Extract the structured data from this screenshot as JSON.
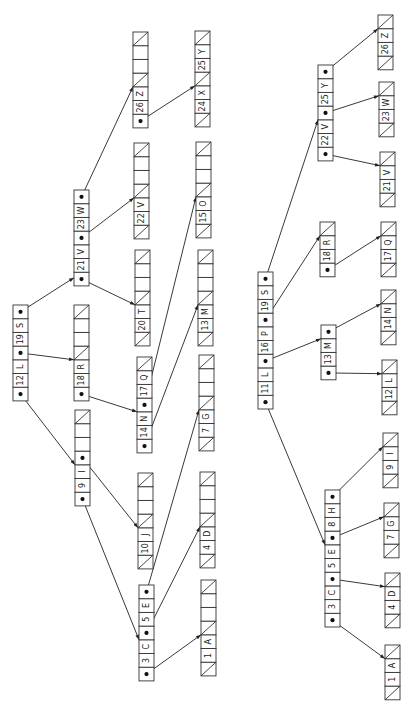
{
  "figure": {
    "orientation": "rotated-ccw",
    "cell_height": 13.7,
    "cell_width": 15
  },
  "trees": [
    {
      "name": "left-tree",
      "nodes": [
        {
          "id": "L-root",
          "x": 13,
          "y": 305,
          "cells": [
            "ptr",
            "12",
            "L",
            "ptr",
            "19",
            "S",
            "ptr"
          ]
        },
        {
          "id": "L-21V23W",
          "x": 74,
          "y": 190,
          "cells": [
            "ptr",
            "21",
            "V",
            "ptr",
            "23",
            "W",
            "ptr"
          ]
        },
        {
          "id": "L-18R",
          "x": 74,
          "y": 305,
          "cells": [
            "ptr",
            "18",
            "R",
            "nil",
            "",
            "",
            "nil"
          ]
        },
        {
          "id": "L-9I",
          "x": 75,
          "y": 410,
          "cells": [
            "ptr",
            "9",
            "I",
            "ptr",
            "",
            "",
            "nil"
          ]
        },
        {
          "id": "L-26Z",
          "x": 133,
          "y": 32,
          "cells": [
            "ptr",
            "26",
            "Z",
            "nil",
            "",
            "",
            "nil"
          ]
        },
        {
          "id": "L-22V",
          "x": 134,
          "y": 143,
          "cells": [
            "nil",
            "22",
            "V",
            "nil",
            "",
            "",
            "nil"
          ]
        },
        {
          "id": "L-20T",
          "x": 135,
          "y": 250,
          "cells": [
            "nil",
            "20",
            "T",
            "nil",
            "",
            "",
            "nil"
          ]
        },
        {
          "id": "L-14N17Q",
          "x": 137,
          "y": 357,
          "cells": [
            "ptr",
            "14",
            "N",
            "ptr",
            "17",
            "Q",
            "nil"
          ]
        },
        {
          "id": "L-10J",
          "x": 138,
          "y": 473,
          "cells": [
            "nil",
            "10",
            "J",
            "nil",
            "",
            "",
            "nil"
          ]
        },
        {
          "id": "L-3C5E",
          "x": 139,
          "y": 585,
          "cells": [
            "ptr",
            "3",
            "C",
            "ptr",
            "5",
            "E",
            "ptr"
          ]
        },
        {
          "id": "L-24X25Y",
          "x": 195,
          "y": 31,
          "cells": [
            "nil",
            "24",
            "X",
            "nil",
            "25",
            "Y",
            "nil"
          ]
        },
        {
          "id": "L-15O",
          "x": 196,
          "y": 142,
          "cells": [
            "nil",
            "15",
            "O",
            "nil",
            "",
            "",
            "nil"
          ]
        },
        {
          "id": "L-13M",
          "x": 198,
          "y": 250,
          "cells": [
            "nil",
            "13",
            "M",
            "nil",
            "",
            "",
            "nil"
          ]
        },
        {
          "id": "L-7G",
          "x": 199,
          "y": 355,
          "cells": [
            "nil",
            "7",
            "G",
            "nil",
            "",
            "",
            "nil"
          ]
        },
        {
          "id": "L-4D",
          "x": 200,
          "y": 472,
          "cells": [
            "nil",
            "4",
            "D",
            "nil",
            "",
            "",
            "nil"
          ]
        },
        {
          "id": "L-1A",
          "x": 201,
          "y": 580,
          "cells": [
            "nil",
            "1",
            "A",
            "nil",
            "",
            "",
            "nil"
          ]
        }
      ],
      "edges": [
        {
          "from": "L-root",
          "cell": 6,
          "to": "L-21V23W",
          "tcell": 0.6
        },
        {
          "from": "L-root",
          "cell": 3,
          "to": "L-18R",
          "tcell": 3
        },
        {
          "from": "L-root",
          "cell": 0,
          "to": "L-9I",
          "tcell": 3
        },
        {
          "from": "L-21V23W",
          "cell": 6,
          "to": "L-26Z",
          "tcell": 3
        },
        {
          "from": "L-21V23W",
          "cell": 3,
          "to": "L-22V",
          "tcell": 3
        },
        {
          "from": "L-21V23W",
          "cell": 0,
          "to": "L-20T",
          "tcell": 3
        },
        {
          "from": "L-18R",
          "cell": 0,
          "to": "L-14N17Q",
          "tcell": 3
        },
        {
          "from": "L-9I",
          "cell": 3,
          "to": "L-10J",
          "tcell": 3
        },
        {
          "from": "L-9I",
          "cell": 0,
          "to": "L-3C5E",
          "tcell": 3
        },
        {
          "from": "L-26Z",
          "cell": 0,
          "to": "L-24X25Y",
          "tcell": 3
        },
        {
          "from": "L-14N17Q",
          "cell": 3,
          "to": "L-15O",
          "tcell": 3
        },
        {
          "from": "L-14N17Q",
          "cell": 0,
          "to": "L-13M",
          "tcell": 3
        },
        {
          "from": "L-3C5E",
          "cell": 6,
          "to": "L-7G",
          "tcell": 3
        },
        {
          "from": "L-3C5E",
          "cell": 3,
          "to": "L-4D",
          "tcell": 3
        },
        {
          "from": "L-3C5E",
          "cell": 0,
          "to": "L-1A",
          "tcell": 3
        }
      ]
    },
    {
      "name": "right-tree",
      "nodes": [
        {
          "id": "R-root",
          "x": 258,
          "y": 272,
          "cells": [
            "ptr",
            "11",
            "L",
            "ptr",
            "16",
            "P",
            "ptr",
            "19",
            "S",
            "ptr"
          ]
        },
        {
          "id": "R-22V25Y",
          "x": 318,
          "y": 65,
          "cells": [
            "ptr",
            "22",
            "V",
            "ptr",
            "25",
            "Y",
            "ptr"
          ]
        },
        {
          "id": "R-18R",
          "x": 320,
          "y": 222,
          "cells": [
            "ptr",
            "18",
            "R",
            "nil"
          ]
        },
        {
          "id": "R-13M",
          "x": 321,
          "y": 325,
          "cells": [
            "ptr",
            "13",
            "M",
            "ptr"
          ]
        },
        {
          "id": "R-3C5E8H",
          "x": 325,
          "y": 490,
          "cells": [
            "ptr",
            "3",
            "C",
            "ptr",
            "5",
            "E",
            "ptr",
            "8",
            "H",
            "ptr"
          ]
        },
        {
          "id": "R-26Z",
          "x": 378,
          "y": 15,
          "cells": [
            "nil",
            "26",
            "Z",
            "nil"
          ]
        },
        {
          "id": "R-23W",
          "x": 379,
          "y": 82,
          "cells": [
            "nil",
            "23",
            "W",
            "nil"
          ]
        },
        {
          "id": "R-21V",
          "x": 380,
          "y": 152,
          "cells": [
            "nil",
            "21",
            "V",
            "nil"
          ]
        },
        {
          "id": "R-17Q",
          "x": 381,
          "y": 222,
          "cells": [
            "nil",
            "17",
            "Q",
            "nil"
          ]
        },
        {
          "id": "R-14N",
          "x": 381,
          "y": 290,
          "cells": [
            "nil",
            "14",
            "N",
            "nil"
          ]
        },
        {
          "id": "R-12L",
          "x": 382,
          "y": 360,
          "cells": [
            "nil",
            "12",
            "L",
            "nil"
          ]
        },
        {
          "id": "R-9I",
          "x": 383,
          "y": 433,
          "cells": [
            "nil",
            "9",
            "I",
            "nil"
          ]
        },
        {
          "id": "R-7G",
          "x": 384,
          "y": 503,
          "cells": [
            "nil",
            "7",
            "G",
            "nil"
          ]
        },
        {
          "id": "R-4D",
          "x": 385,
          "y": 573,
          "cells": [
            "nil",
            "4",
            "D",
            "nil"
          ]
        },
        {
          "id": "R-1A",
          "x": 385,
          "y": 645,
          "cells": [
            "nil",
            "1",
            "A",
            "nil"
          ]
        }
      ],
      "edges": [
        {
          "from": "R-root",
          "cell": 9,
          "to": "R-22V25Y",
          "tcell": 3
        },
        {
          "from": "R-root",
          "cell": 6,
          "to": "R-18R",
          "tcell": 3
        },
        {
          "from": "R-root",
          "cell": 3,
          "to": "R-13M",
          "tcell": 3
        },
        {
          "from": "R-root",
          "cell": 0,
          "to": "R-3C5E8H",
          "tcell": 6
        },
        {
          "from": "R-22V25Y",
          "cell": 6,
          "to": "R-26Z",
          "tcell": 3
        },
        {
          "from": "R-22V25Y",
          "cell": 3,
          "to": "R-23W",
          "tcell": 3
        },
        {
          "from": "R-22V25Y",
          "cell": 0,
          "to": "R-21V",
          "tcell": 3
        },
        {
          "from": "R-18R",
          "cell": 0,
          "to": "R-17Q",
          "tcell": 3
        },
        {
          "from": "R-13M",
          "cell": 3,
          "to": "R-14N",
          "tcell": 3
        },
        {
          "from": "R-13M",
          "cell": 0,
          "to": "R-12L",
          "tcell": 3
        },
        {
          "from": "R-3C5E8H",
          "cell": 9,
          "to": "R-9I",
          "tcell": 3
        },
        {
          "from": "R-3C5E8H",
          "cell": 6,
          "to": "R-7G",
          "tcell": 3
        },
        {
          "from": "R-3C5E8H",
          "cell": 3,
          "to": "R-4D",
          "tcell": 3
        },
        {
          "from": "R-3C5E8H",
          "cell": 0,
          "to": "R-1A",
          "tcell": 3
        }
      ]
    }
  ]
}
